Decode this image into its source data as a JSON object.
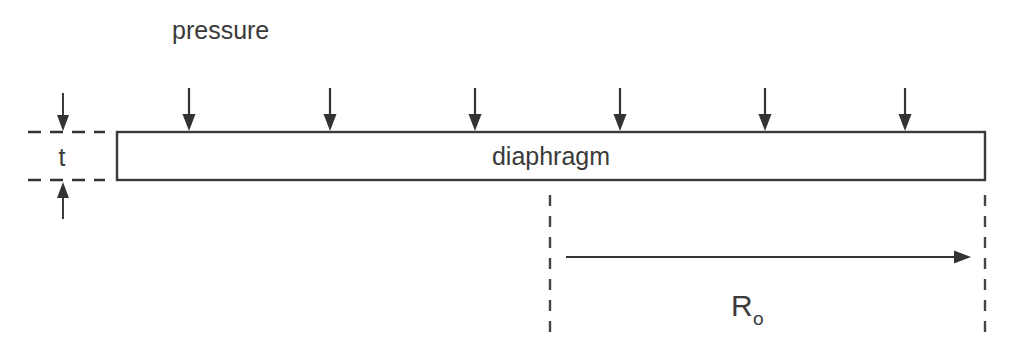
{
  "diagram": {
    "background_color": "#ffffff",
    "ink_color": "#3a3a3a",
    "labels": {
      "pressure": "pressure",
      "diaphragm": "diaphragm",
      "thickness": "t",
      "radius_base": "R",
      "radius_subscript": "o"
    },
    "diaphragm_box": {
      "x": 117,
      "y": 132,
      "width": 868,
      "height": 48
    },
    "pressure_arrows": {
      "count": 6,
      "x_positions": [
        189,
        330,
        475,
        620,
        765,
        905
      ],
      "y_top": 88,
      "y_tip": 131,
      "direction": "down"
    },
    "thickness_dimension": {
      "dashed_line_x_start": 28,
      "dashed_line_x_end": 105,
      "top_line_y": 132,
      "bottom_line_y": 180,
      "label_x": 62,
      "label_y": 166,
      "arrow_x": 63,
      "top_arrow_y_start": 93,
      "top_arrow_y_tip": 131,
      "bottom_arrow_y_start": 219,
      "bottom_arrow_y_tip": 182
    },
    "radius_dimension": {
      "left_dashed_x": 550,
      "right_dashed_x": 985,
      "dashed_y_start": 195,
      "dashed_y_end": 340,
      "arrow_y": 257,
      "arrow_x_start": 566,
      "arrow_x_tip": 971,
      "label_x": 731,
      "label_y": 316,
      "label_sub_x": 755,
      "label_sub_y": 325
    }
  }
}
